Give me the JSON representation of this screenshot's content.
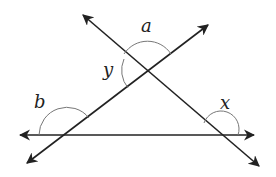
{
  "diagram": {
    "type": "geometry-intersecting-lines",
    "colors": {
      "line": "#222222",
      "arc": "#777777",
      "background": "#ffffff"
    },
    "lines": [
      {
        "name": "horizontal-line",
        "arrows": "both"
      },
      {
        "name": "rising-line",
        "arrows": "both"
      },
      {
        "name": "falling-line",
        "arrows": "both"
      }
    ],
    "angles": [
      {
        "id": "a",
        "label": "a",
        "vertex": "intersection of rising and falling lines",
        "position": "top"
      },
      {
        "id": "y",
        "label": "y",
        "vertex": "intersection of rising and falling lines",
        "position": "left"
      },
      {
        "id": "b",
        "label": "b",
        "vertex": "intersection of rising line and horizontal line",
        "position": "upper-left exterior"
      },
      {
        "id": "x",
        "label": "x",
        "vertex": "intersection of falling line and horizontal line",
        "position": "upper-right exterior"
      }
    ]
  }
}
